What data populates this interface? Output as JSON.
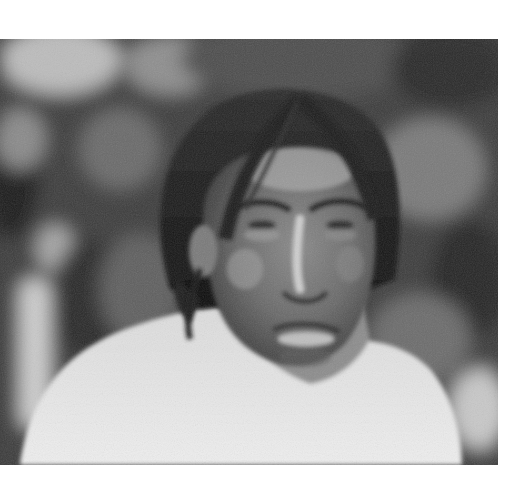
{
  "page": {
    "background": "#ffffff"
  },
  "photo": {
    "alt": "Black-and-white portrait photograph of a man with long dark hair parted in the middle, bare shoulders, against a blurred foliage background",
    "style": "monochrome",
    "colors": {
      "background_dark": "#1e1e1e",
      "background_mid": "#5a5a5a",
      "background_light": "#b8b8b8",
      "hair": "#141414",
      "skin_shadow": "#3c3c3c",
      "skin_mid": "#6e6e6e",
      "skin_highlight": "#bdbdbd",
      "shoulders": "#e4e4e4"
    }
  }
}
